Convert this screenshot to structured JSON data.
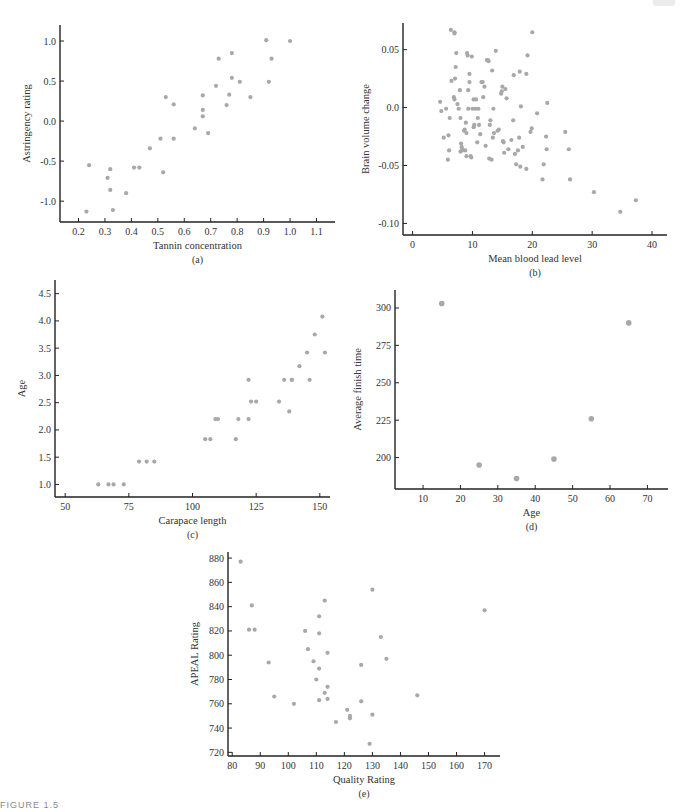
{
  "figure": {
    "caption": "FIGURE 1.5",
    "point_color": "#a8a8a8",
    "axis_color": "#222222"
  },
  "chart_data": [
    {
      "id": "a",
      "type": "scatter",
      "panel_label": "(a)",
      "title": "",
      "xlabel": "Tannin concentration",
      "ylabel": "Astringency rating",
      "xticks": [
        "0.2",
        "0.3",
        "0.4",
        "0.5",
        "0.6",
        "0.7",
        "0.8",
        "0.9",
        "1.0",
        "1.1"
      ],
      "yticks": [
        "-1.0",
        "-0.5",
        "0.0",
        "0.5",
        "1.0"
      ],
      "xlim": [
        0.13,
        1.17
      ],
      "ylim": [
        -1.26,
        1.2
      ],
      "grid": false,
      "box": {
        "left": 60,
        "top": 25,
        "right": 335,
        "bottom": 222
      },
      "x": [
        0.23,
        0.24,
        0.31,
        0.32,
        0.32,
        0.33,
        0.38,
        0.41,
        0.43,
        0.47,
        0.51,
        0.52,
        0.53,
        0.56,
        0.56,
        0.64,
        0.67,
        0.67,
        0.67,
        0.69,
        0.72,
        0.73,
        0.76,
        0.77,
        0.78,
        0.78,
        0.81,
        0.85,
        0.91,
        0.92,
        0.93,
        1.0
      ],
      "y": [
        -1.13,
        -0.55,
        -0.71,
        -0.6,
        -0.86,
        -1.11,
        -0.9,
        -0.58,
        -0.58,
        -0.34,
        -0.22,
        -0.64,
        0.3,
        0.21,
        -0.22,
        -0.09,
        0.32,
        0.14,
        0.06,
        -0.15,
        0.44,
        0.78,
        0.2,
        0.33,
        0.54,
        0.85,
        0.49,
        0.3,
        1.01,
        0.49,
        0.78,
        1.0
      ]
    },
    {
      "id": "b",
      "type": "scatter",
      "panel_label": "(b)",
      "title": "",
      "xlabel": "Mean blood lead level",
      "ylabel": "Brain volume change",
      "xticks": [
        "0",
        "10",
        "20",
        "30",
        "40"
      ],
      "yticks": [
        "-0.10",
        "-0.05",
        "0.0",
        "0.05"
      ],
      "xlim": [
        -1.6,
        42.5
      ],
      "ylim": [
        -0.11,
        0.073
      ],
      "grid": false,
      "box": {
        "left": 403,
        "top": 23,
        "right": 667,
        "bottom": 235
      },
      "x": [
        4.6,
        4.8,
        5.6,
        5.2,
        6.0,
        6.2,
        5.9,
        6.1,
        6.5,
        6.9,
        7.0,
        7.1,
        7.2,
        7.3,
        7.5,
        7.0,
        7.7,
        7.9,
        8.0,
        8.1,
        8.2,
        8.3,
        8.3,
        8.6,
        8.7,
        8.8,
        8.9,
        9.0,
        9.1,
        9.2,
        9.3,
        9.3,
        9.5,
        9.7,
        9.8,
        9.9,
        10.0,
        10.2,
        10.3,
        10.5,
        10.6,
        10.8,
        10.9,
        11.0,
        11.1,
        11.3,
        11.5,
        11.7,
        11.8,
        12.0,
        12.2,
        12.6,
        12.7,
        12.8,
        12.9,
        13.0,
        13.3,
        13.4,
        13.5,
        13.6,
        13.9,
        14.2,
        14.4,
        14.8,
        15.0,
        15.1,
        15.2,
        15.3,
        15.5,
        15.7,
        16.0,
        16.5,
        16.9,
        17.1,
        17.3,
        17.6,
        17.8,
        17.9,
        18.1,
        18.4,
        19.0,
        19.2,
        19.7,
        19.9,
        20.0,
        20.8,
        21.7,
        21.9,
        22.3,
        22.4,
        22.5,
        25.5,
        26.1,
        26.3,
        30.3,
        34.7,
        37.3,
        6.4,
        7.0,
        18.0,
        9.0,
        13.2,
        12.4,
        8.0,
        9.5,
        10.2,
        14.9,
        16.8,
        19.0
      ],
      "y": [
        0.005,
        -0.003,
        -0.001,
        -0.026,
        -0.024,
        -0.009,
        -0.045,
        -0.037,
        0.023,
        0.009,
        0.007,
        0.025,
        0.035,
        0.047,
        0.003,
        0.065,
        -0.001,
        0.015,
        -0.009,
        -0.031,
        -0.034,
        -0.037,
        -0.036,
        -0.02,
        -0.019,
        -0.037,
        -0.013,
        -0.022,
        0.047,
        0.045,
        0.015,
        -0.001,
        0.029,
        -0.042,
        -0.043,
        0.044,
        -0.001,
        -0.017,
        -0.015,
        -0.001,
        0.007,
        -0.03,
        -0.009,
        -0.001,
        -0.015,
        -0.023,
        0.022,
        0.022,
        0.009,
        0.018,
        -0.033,
        0.041,
        0.04,
        -0.044,
        -0.015,
        -0.011,
        0.032,
        -0.026,
        -0.001,
        -0.022,
        0.049,
        -0.02,
        -0.019,
        0.012,
        0.018,
        -0.029,
        -0.03,
        -0.039,
        0.016,
        0.008,
        -0.036,
        -0.028,
        0.028,
        -0.04,
        -0.049,
        -0.037,
        -0.026,
        0.031,
        0.001,
        -0.034,
        -0.053,
        0.045,
        -0.021,
        -0.018,
        0.065,
        -0.005,
        -0.062,
        -0.049,
        -0.025,
        -0.036,
        0.004,
        -0.021,
        -0.036,
        -0.062,
        -0.073,
        -0.09,
        -0.08,
        0.067,
        0.064,
        -0.051,
        -0.042,
        -0.045,
        0.041,
        -0.038,
        0.022,
        0.007,
        0.014,
        -0.011,
        0.029
      ],
      "note": "approximate readings of ~110 points"
    },
    {
      "id": "c",
      "type": "scatter",
      "panel_label": "(c)",
      "title": "",
      "xlabel": "Carapace length",
      "ylabel": "Age",
      "xticks": [
        "50",
        "75",
        "100",
        "125",
        "150"
      ],
      "yticks": [
        "1.0",
        "1.5",
        "2.0",
        "2.5",
        "3.0",
        "3.5",
        "4.0",
        "4.5"
      ],
      "xlim": [
        46,
        154
      ],
      "ylim": [
        0.77,
        4.75
      ],
      "grid": false,
      "box": {
        "left": 55,
        "top": 280,
        "right": 330,
        "bottom": 497
      },
      "x": [
        63,
        67,
        69,
        73,
        79,
        82,
        85,
        105,
        107,
        109,
        110,
        117,
        118,
        122,
        122,
        123,
        125,
        134,
        136,
        138,
        139,
        139,
        142,
        145,
        146,
        148,
        151,
        152
      ],
      "y": [
        1.0,
        1.0,
        1.0,
        1.0,
        1.42,
        1.42,
        1.42,
        1.83,
        1.83,
        2.2,
        2.2,
        1.83,
        2.2,
        2.2,
        2.92,
        2.52,
        2.52,
        2.52,
        2.92,
        2.34,
        2.92,
        2.92,
        3.17,
        3.42,
        2.92,
        3.75,
        4.08,
        3.42
      ]
    },
    {
      "id": "d",
      "type": "scatter",
      "panel_label": "(d)",
      "title": "",
      "xlabel": "Age",
      "ylabel": "Average finish time",
      "xticks": [
        "10",
        "20",
        "30",
        "40",
        "50",
        "60",
        "70"
      ],
      "yticks": [
        "200",
        "225",
        "250",
        "275",
        "300"
      ],
      "xlim": [
        2.5,
        75.5
      ],
      "ylim": [
        179,
        312
      ],
      "grid": false,
      "box": {
        "left": 395,
        "top": 290,
        "right": 668,
        "bottom": 489
      },
      "x": [
        15,
        25,
        35,
        45,
        55,
        65
      ],
      "y": [
        303,
        195,
        186,
        199,
        226,
        290
      ]
    },
    {
      "id": "e",
      "type": "scatter",
      "panel_label": "(e)",
      "title": "",
      "xlabel": "Quality Rating",
      "ylabel": "APEAL Rating",
      "xticks": [
        "80",
        "90",
        "100",
        "110",
        "120",
        "130",
        "140",
        "150",
        "160",
        "170"
      ],
      "yticks": [
        "720",
        "740",
        "760",
        "780",
        "800",
        "820",
        "840",
        "860",
        "880"
      ],
      "xlim": [
        78.5,
        175.5
      ],
      "ylim": [
        717,
        885
      ],
      "grid": false,
      "box": {
        "left": 228,
        "top": 552,
        "right": 500,
        "bottom": 756
      },
      "x": [
        83,
        86,
        87,
        88,
        93,
        95,
        102,
        106,
        107,
        109,
        110,
        111,
        111,
        111,
        111,
        113,
        113,
        114,
        114,
        114,
        117,
        121,
        122,
        122,
        126,
        126,
        129,
        130,
        130,
        133,
        135,
        146,
        170
      ],
      "y": [
        877,
        821,
        841,
        821,
        794,
        766,
        760,
        820,
        805,
        795,
        780,
        832,
        818,
        789,
        763,
        845,
        769,
        802,
        774,
        764,
        745,
        755,
        748,
        750,
        792,
        762,
        727,
        854,
        751,
        815,
        797,
        767,
        837
      ]
    }
  ]
}
